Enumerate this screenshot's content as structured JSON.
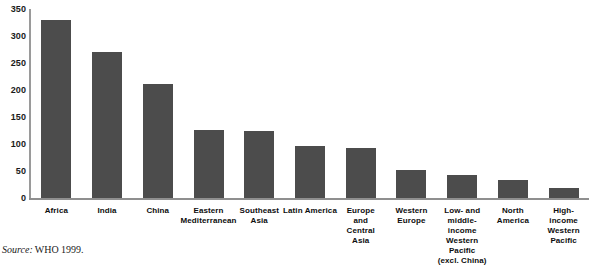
{
  "chart_data": {
    "type": "bar",
    "title": "",
    "xlabel": "",
    "ylabel": "",
    "ylim": [
      0,
      350
    ],
    "yticks": [
      0,
      50,
      100,
      150,
      200,
      250,
      300,
      350
    ],
    "grid": false,
    "legend": null,
    "bar_color": "#4c4c4c",
    "categories": [
      "Africa",
      "India",
      "China",
      "Eastern\nMediterranean",
      "Southeast\nAsia",
      "Latin America",
      "Europe\nand\nCentral\nAsia",
      "Western\nEurope",
      "Low- and\nmiddle-\nincome\nWestern\nPacific\n(excl. China)",
      "North\nAmerica",
      "High-\nincome\nWestern\nPacific"
    ],
    "values": [
      330,
      270,
      212,
      126,
      124,
      96,
      92,
      51,
      43,
      34,
      19
    ]
  },
  "axis": {
    "y_tick_labels": [
      "350",
      "300",
      "250",
      "200",
      "150",
      "100",
      "50",
      "0"
    ]
  },
  "categories_lines": [
    [
      "Africa"
    ],
    [
      "India"
    ],
    [
      "China"
    ],
    [
      "Eastern",
      "Mediterranean"
    ],
    [
      "Southeast",
      "Asia"
    ],
    [
      "Latin America"
    ],
    [
      "Europe",
      "and",
      "Central",
      "Asia"
    ],
    [
      "Western",
      "Europe"
    ],
    [
      "Low- and",
      "middle-",
      "income",
      "Western",
      "Pacific",
      "(excl. China)"
    ],
    [
      "North",
      "America"
    ],
    [
      "High-",
      "income",
      "Western",
      "Pacific"
    ]
  ],
  "footer": {
    "source_word": "Source:",
    "source_text": "WHO 1999."
  }
}
